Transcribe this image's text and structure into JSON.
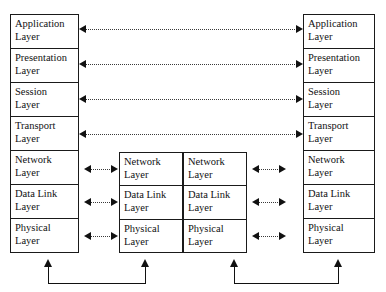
{
  "diagram": {
    "colors": {
      "line": "#111111",
      "dotted_link": "#3a3a3a",
      "background": "#ffffff"
    },
    "end_systems": {
      "left": {
        "name": "left-end-system",
        "layers": [
          {
            "line1": "Application",
            "line2": "Layer"
          },
          {
            "line1": "Presentation",
            "line2": "Layer"
          },
          {
            "line1": "Session",
            "line2": "Layer"
          },
          {
            "line1": "Transport",
            "line2": "Layer"
          },
          {
            "line1": "Network",
            "line2": "Layer"
          },
          {
            "line1": "Data Link",
            "line2": "Layer"
          },
          {
            "line1": "Physical",
            "line2": "Layer"
          }
        ]
      },
      "right": {
        "name": "right-end-system",
        "layers": [
          {
            "line1": "Application",
            "line2": "Layer"
          },
          {
            "line1": "Presentation",
            "line2": "Layer"
          },
          {
            "line1": "Session",
            "line2": "Layer"
          },
          {
            "line1": "Transport",
            "line2": "Layer"
          },
          {
            "line1": "Network",
            "line2": "Layer"
          },
          {
            "line1": "Data Link",
            "line2": "Layer"
          },
          {
            "line1": "Physical",
            "line2": "Layer"
          }
        ]
      }
    },
    "intermediate_nodes": {
      "left": {
        "name": "intermediate-node-left",
        "layers": [
          {
            "line1": "Network",
            "line2": "Layer"
          },
          {
            "line1": "Data Link",
            "line2": "Layer"
          },
          {
            "line1": "Physical",
            "line2": "Layer"
          }
        ]
      },
      "right": {
        "name": "intermediate-node-right",
        "layers": [
          {
            "line1": "Network",
            "line2": "Layer"
          },
          {
            "line1": "Data Link",
            "line2": "Layer"
          },
          {
            "line1": "Physical",
            "line2": "Layer"
          }
        ]
      }
    },
    "peer_links": [
      {
        "layer": "Application",
        "style": "dotted",
        "arrows": "both"
      },
      {
        "layer": "Presentation",
        "style": "dotted",
        "arrows": "both"
      },
      {
        "layer": "Session",
        "style": "dotted",
        "arrows": "both"
      },
      {
        "layer": "Transport",
        "style": "dotted",
        "arrows": "both"
      },
      {
        "layer": "Network",
        "style": "dotted",
        "arrows": "both"
      },
      {
        "layer": "Data Link",
        "style": "dotted",
        "arrows": "both"
      },
      {
        "layer": "Physical",
        "style": "dotted",
        "arrows": "both"
      }
    ],
    "physical_media": [
      {
        "from": "left-end-system-physical",
        "to": "intermediate-node-left-physical",
        "arrows": "both-up"
      },
      {
        "from": "intermediate-node-right-physical",
        "to": "right-end-system-physical",
        "arrows": "both-up"
      }
    ]
  }
}
